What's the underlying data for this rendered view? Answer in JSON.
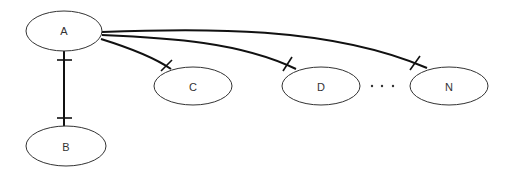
{
  "diagram": {
    "type": "hierarchy / relationship diagram",
    "nodes": [
      {
        "id": "A",
        "label": "A",
        "cx": 64,
        "cy": 31,
        "rx": 38,
        "ry": 20
      },
      {
        "id": "B",
        "label": "B",
        "cx": 66,
        "cy": 146,
        "rx": 40,
        "ry": 20
      },
      {
        "id": "C",
        "label": "C",
        "cx": 193,
        "cy": 86,
        "rx": 39,
        "ry": 19
      },
      {
        "id": "D",
        "label": "D",
        "cx": 321,
        "cy": 86,
        "rx": 39,
        "ry": 19
      },
      {
        "id": "N",
        "label": "N",
        "cx": 449,
        "cy": 86,
        "rx": 39,
        "ry": 19
      }
    ],
    "edges": [
      {
        "from": "A",
        "to": "B",
        "style": "one-to-one",
        "markers": "bar at both ends"
      },
      {
        "from": "A",
        "to": "C",
        "style": "one",
        "markers": "bar at C end"
      },
      {
        "from": "A",
        "to": "D",
        "style": "one",
        "markers": "bar at D end"
      },
      {
        "from": "A",
        "to": "N",
        "style": "one",
        "markers": "bar at N end"
      }
    ],
    "ellipsis": "· · ·",
    "colors": {
      "node_stroke": "#333333",
      "edge_stroke": "#111111",
      "background": "#ffffff"
    }
  }
}
